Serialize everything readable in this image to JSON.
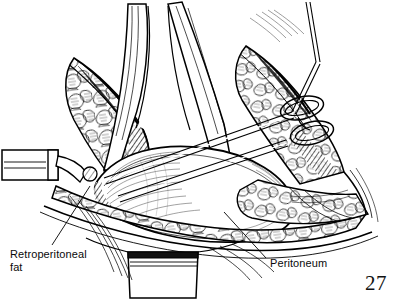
{
  "figure": {
    "type": "surgical-line-illustration",
    "medium": "pen-and-ink",
    "ink_color": "#000000",
    "background_color": "#ffffff",
    "page_number": "27",
    "labels": [
      {
        "id": "retroperitoneal-fat",
        "line1": "Retroperitoneal",
        "line2": "fat",
        "text": "Retroperitoneal fat",
        "x": 10,
        "y": 248,
        "leader": {
          "from_x": 52,
          "from_y": 245,
          "to_x": 90,
          "to_y": 186
        }
      },
      {
        "id": "peritoneum",
        "text": "Peritoneum",
        "x": 270,
        "y": 257,
        "leader": {
          "from_x": 266,
          "from_y": 258,
          "to_x": 224,
          "to_y": 212
        }
      }
    ],
    "structures": [
      {
        "name": "retroperitoneal-fat-left-wedge",
        "texture": "lobulated-cobblestone"
      },
      {
        "name": "retroperitoneal-fat-right-wedge",
        "texture": "lobulated-cobblestone"
      },
      {
        "name": "peritoneal-sac-dome",
        "texture": "fine-parallel-hatching"
      },
      {
        "name": "abdominal-wall-fat-lower-band",
        "texture": "lobulated-cobblestone"
      },
      {
        "name": "retractor-blade-left",
        "texture": "smooth-metal"
      },
      {
        "name": "retractor-blade-center-upper",
        "texture": "smooth-metal"
      },
      {
        "name": "retractor-blade-bottom",
        "texture": "smooth-metal"
      },
      {
        "name": "ring-forceps-handle",
        "texture": "smooth-metal"
      },
      {
        "name": "dissector-shaft",
        "texture": "smooth-metal"
      }
    ]
  }
}
